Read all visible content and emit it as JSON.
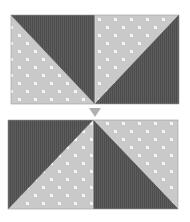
{
  "diagram": {
    "colors": {
      "dark": "#5c5c5c",
      "dark_stripe": "#4e4e4e",
      "light": "#c9c9c9",
      "dot": "#f4f4f4",
      "arrow": "#b0b0b0",
      "background": "#ffffff"
    },
    "top_block": {
      "x": 11,
      "y": 15,
      "width": 168,
      "height": 89,
      "left_square": {
        "diagonal": "top-left to bottom-right",
        "dark_triangle": "upper-right",
        "light_triangle": "lower-left"
      },
      "right_square": {
        "diagonal": "bottom-left to top-right",
        "dark_triangle": "lower-right",
        "light_triangle": "upper-left"
      }
    },
    "arrow": {
      "direction": "down",
      "cx": 95,
      "top": 108,
      "bottom": 117
    },
    "bottom_block": {
      "x": 8,
      "y": 120,
      "width": 170,
      "height": 89,
      "left_square": {
        "diagonal": "bottom-left to top-right",
        "dark_triangle": "upper-left",
        "light_triangle": "lower-right"
      },
      "right_square": {
        "diagonal": "top-left to bottom-right",
        "dark_triangle": "lower-left",
        "light_triangle": "upper-right"
      }
    }
  }
}
